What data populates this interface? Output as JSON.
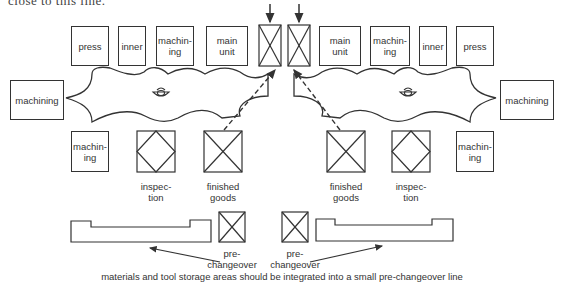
{
  "top_cut_text": "close to this line.",
  "left_cell": {
    "top_row": [
      "press",
      "inner",
      "machin-\ning",
      "main\nunit"
    ],
    "side": "machining",
    "bottom_row": [
      "machin-\ning"
    ],
    "inspection_label": "inspec-\ntion",
    "finished_goods_label": "finished\ngoods"
  },
  "right_cell": {
    "top_row": [
      "main\nunit",
      "machin-\ning",
      "inner",
      "press"
    ],
    "side": "machining",
    "bottom_row": [
      "machin-\ning"
    ],
    "inspection_label": "inspec-\ntion",
    "finished_goods_label": "finished\ngoods"
  },
  "center": {
    "inputs": [
      "input-box-left",
      "input-box-right"
    ]
  },
  "bottom": {
    "pre_changeover_left": "pre-\nchangeover",
    "pre_changeover_right": "pre-\nchangeover",
    "caption": "materials and tool storage areas should be integrated into a small pre-changeover line"
  },
  "colors": {
    "line": "#333333",
    "background": "#ffffff"
  }
}
